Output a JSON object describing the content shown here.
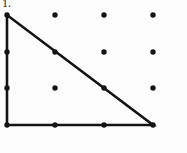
{
  "figure": {
    "label": "1.",
    "caption_visible": true,
    "background_color": "#fdfdfd",
    "ink_color": "#141414",
    "width": 187,
    "height": 153
  },
  "chart_data": {
    "type": "scatter",
    "title": "",
    "subtitle": "",
    "xlabel": "",
    "ylabel": "",
    "grid": false,
    "legend": "none",
    "grid_spec": {
      "rows": 4,
      "cols": 4,
      "x_positions": [
        7,
        55,
        104,
        153
      ],
      "y_positions": [
        15,
        52,
        88,
        125
      ],
      "dot_radius": 2.7
    },
    "points": [
      {
        "col": 0,
        "row": 0,
        "x": 7,
        "y": 15,
        "on_shape": true
      },
      {
        "col": 1,
        "row": 0,
        "x": 55,
        "y": 15,
        "on_shape": false
      },
      {
        "col": 2,
        "row": 0,
        "x": 104,
        "y": 15,
        "on_shape": false
      },
      {
        "col": 3,
        "row": 0,
        "x": 153,
        "y": 15,
        "on_shape": false
      },
      {
        "col": 0,
        "row": 1,
        "x": 7,
        "y": 52,
        "on_shape": true
      },
      {
        "col": 1,
        "row": 1,
        "x": 55,
        "y": 52,
        "on_shape": true
      },
      {
        "col": 2,
        "row": 1,
        "x": 104,
        "y": 52,
        "on_shape": false
      },
      {
        "col": 3,
        "row": 1,
        "x": 153,
        "y": 52,
        "on_shape": false
      },
      {
        "col": 0,
        "row": 2,
        "x": 7,
        "y": 88,
        "on_shape": true
      },
      {
        "col": 1,
        "row": 2,
        "x": 55,
        "y": 88,
        "on_shape": false
      },
      {
        "col": 2,
        "row": 2,
        "x": 104,
        "y": 88,
        "on_shape": true
      },
      {
        "col": 3,
        "row": 2,
        "x": 153,
        "y": 88,
        "on_shape": false
      },
      {
        "col": 0,
        "row": 3,
        "x": 7,
        "y": 125,
        "on_shape": true
      },
      {
        "col": 1,
        "row": 3,
        "x": 55,
        "y": 125,
        "on_shape": true
      },
      {
        "col": 2,
        "row": 3,
        "x": 104,
        "y": 125,
        "on_shape": true
      },
      {
        "col": 3,
        "row": 3,
        "x": 153,
        "y": 125,
        "on_shape": true
      }
    ],
    "shape": {
      "name": "right-triangle",
      "closed": true,
      "vertices": [
        {
          "x": 7,
          "y": 15,
          "label": "top-left"
        },
        {
          "x": 7,
          "y": 125,
          "label": "bottom-left"
        },
        {
          "x": 153,
          "y": 125,
          "label": "bottom-right"
        }
      ],
      "edges": [
        {
          "name": "vertical-leg",
          "from": [
            7,
            15
          ],
          "to": [
            7,
            125
          ]
        },
        {
          "name": "horizontal-leg",
          "from": [
            7,
            125
          ],
          "to": [
            153,
            125
          ]
        },
        {
          "name": "hypotenuse",
          "from": [
            153,
            125
          ],
          "to": [
            7,
            15
          ]
        }
      ],
      "stroke_width": 2.6,
      "stroke_color": "#141414",
      "fill": "none"
    }
  }
}
